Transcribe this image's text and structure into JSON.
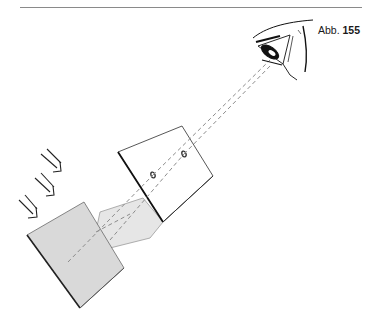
{
  "figure": {
    "prefix": "Abb.",
    "number": "155"
  },
  "colors": {
    "rule": "#8a8a8a",
    "plate_fill": "#d9d9d9",
    "beam_fill": "#e6e6e6",
    "card_fill": "#ffffff",
    "outline": "#222222",
    "dash": "#8c8c8c"
  },
  "elements": {
    "light_arrows": 3,
    "card_holes": 2,
    "sight_lines": 2
  }
}
